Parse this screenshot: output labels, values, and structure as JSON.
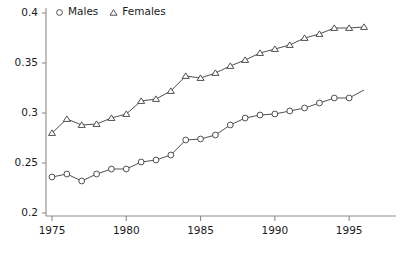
{
  "chart_data": {
    "type": "line",
    "title": "",
    "subtitle": "",
    "xlabel": "",
    "ylabel": "",
    "xlim": [
      1975,
      1996
    ],
    "ylim": [
      0.2,
      0.4
    ],
    "grid": false,
    "legend_position": "top-left",
    "x": [
      1975,
      1976,
      1977,
      1978,
      1979,
      1980,
      1981,
      1982,
      1983,
      1984,
      1985,
      1986,
      1987,
      1988,
      1989,
      1990,
      1991,
      1992,
      1993,
      1994,
      1995,
      1996
    ],
    "xticks": [
      1975,
      1980,
      1985,
      1990,
      1995
    ],
    "xtick_labels": [
      "1975",
      "1980",
      "1985",
      "1990",
      "1995"
    ],
    "yticks": [
      0.2,
      0.25,
      0.3,
      0.35,
      0.4
    ],
    "ytick_labels": [
      "0.2",
      "0.25",
      "0.3",
      "0.35",
      "0.4"
    ],
    "series": [
      {
        "name": "Males",
        "marker": "circle",
        "color": "#3c3c3c",
        "values": [
          0.236,
          0.239,
          0.232,
          0.239,
          0.244,
          0.244,
          0.251,
          0.253,
          0.258,
          0.273,
          0.274,
          0.278,
          0.288,
          0.295,
          0.298,
          0.299,
          0.302,
          0.305,
          0.31,
          0.315,
          0.315,
          0.323
        ],
        "marker_x": [
          1975,
          1976,
          1977,
          1978,
          1979,
          1980,
          1981,
          1982,
          1983,
          1984,
          1985,
          1986,
          1987,
          1988,
          1989,
          1990,
          1991,
          1992,
          1993,
          1994,
          1995
        ]
      },
      {
        "name": "Females",
        "marker": "triangle",
        "color": "#3c3c3c",
        "values": [
          0.28,
          0.294,
          0.288,
          0.289,
          0.295,
          0.299,
          0.312,
          0.314,
          0.322,
          0.337,
          0.335,
          0.34,
          0.347,
          0.353,
          0.36,
          0.364,
          0.368,
          0.375,
          0.379,
          0.385,
          0.385,
          0.386
        ],
        "marker_x": [
          1975,
          1976,
          1977,
          1978,
          1979,
          1980,
          1981,
          1982,
          1983,
          1984,
          1985,
          1986,
          1987,
          1988,
          1989,
          1990,
          1991,
          1992,
          1993,
          1994,
          1995,
          1996
        ]
      }
    ],
    "legend": [
      {
        "label": "Males",
        "marker": "circle"
      },
      {
        "label": "Females",
        "marker": "triangle"
      }
    ]
  },
  "axis": {
    "line_color": "#8c8c8c",
    "text_color": "#1a1a1a"
  }
}
